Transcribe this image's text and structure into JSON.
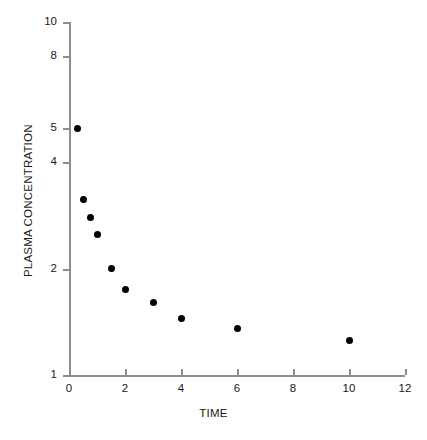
{
  "chart_data": {
    "type": "scatter",
    "title": "",
    "xlabel": "TIME",
    "ylabel": "PLASMA CONCENTRATION",
    "xlim": [
      0,
      12
    ],
    "ylim": [
      1,
      10
    ],
    "yscale": "log",
    "xscale": "linear",
    "grid": false,
    "legend": null,
    "xticks": [
      0,
      2,
      4,
      6,
      8,
      10,
      12
    ],
    "xticklabels": [
      "0",
      "2",
      "4",
      "6",
      "8",
      "10",
      "12"
    ],
    "yticks": [
      1,
      2,
      4,
      5,
      8,
      10
    ],
    "yticklabels": [
      "1",
      "2",
      "4",
      "5",
      "8",
      "10"
    ],
    "marker": "filled-circle",
    "marker_color": "#000000",
    "axis_color": "#8c8c8c",
    "background_color": "#ffffff",
    "x": [
      0.3,
      0.5,
      0.75,
      1.0,
      1.5,
      2.0,
      3.0,
      4.0,
      6.0,
      10.0
    ],
    "y": [
      5.0,
      3.15,
      2.8,
      2.5,
      2.0,
      1.75,
      1.6,
      1.45,
      1.35,
      1.25
    ],
    "points": [
      {
        "x": 0.3,
        "y": 5.0
      },
      {
        "x": 0.5,
        "y": 3.15
      },
      {
        "x": 0.75,
        "y": 2.8
      },
      {
        "x": 1.0,
        "y": 2.5
      },
      {
        "x": 1.5,
        "y": 2.0
      },
      {
        "x": 2.0,
        "y": 1.75
      },
      {
        "x": 3.0,
        "y": 1.6
      },
      {
        "x": 4.0,
        "y": 1.45
      },
      {
        "x": 6.0,
        "y": 1.35
      },
      {
        "x": 10.0,
        "y": 1.25
      }
    ]
  }
}
